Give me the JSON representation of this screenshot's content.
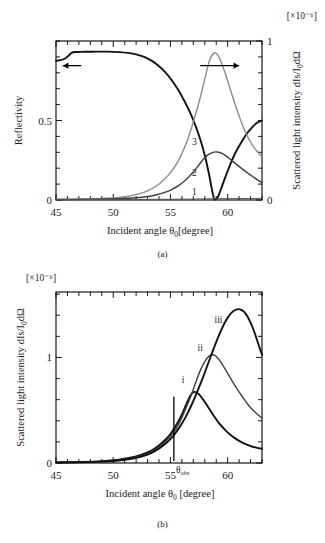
{
  "figure": {
    "panel_a_caption": "(a)",
    "panel_b_caption": "(b)",
    "exponent_label_a": "[×10⁻⁶]",
    "exponent_label_b": "[×10⁻⁶]",
    "bottom_note": ""
  },
  "chart_data": [
    {
      "id": "panel-a",
      "type": "line",
      "title": "",
      "panel_label": "(a)",
      "xlabel_parts": {
        "main": "Incident angle",
        "symbol": "θ",
        "subscript": "0",
        "units": "[degree]"
      },
      "xlabel": "Incident angle θ0 [degree]",
      "ylabel_left": "Reflectivity",
      "ylabel_right_parts": {
        "main": "Scattered light intensity",
        "formula": "dIs/I",
        "formula_sub": "0",
        "formula_tail": "dΩ"
      },
      "ylabel_right": "Scattered light intensity dIs/I0dΩ",
      "right_axis_scale": "[×10⁻⁶]",
      "xlim": [
        45,
        63
      ],
      "xticks_major": [
        45,
        50,
        55,
        60
      ],
      "xticks_minor_step": 1,
      "ylim_left": [
        0,
        1
      ],
      "yticks_left": [
        0,
        0.5
      ],
      "ytick_left_labels": [
        "0",
        "0.5"
      ],
      "ylim_right": [
        0,
        1
      ],
      "yticks_right": [
        0,
        1
      ],
      "ytick_right_labels": [
        "0",
        "1"
      ],
      "grid": false,
      "annotations": [
        {
          "name": "left-axis-arrow",
          "text": "",
          "direction": "left",
          "x_start": 47.2,
          "x_end": 45.6,
          "y_left": 0.845
        },
        {
          "name": "right-axis-arrow",
          "text": "",
          "direction": "right",
          "x_start": 57.6,
          "x_end": 61.0,
          "y_left": 0.845
        }
      ],
      "series": [
        {
          "name": "Reflectivity",
          "label": "",
          "axis": "left",
          "style": "thick-black",
          "points": [
            [
              45.0,
              0.875
            ],
            [
              45.4,
              0.88
            ],
            [
              45.8,
              0.89
            ],
            [
              46.1,
              0.908
            ],
            [
              46.4,
              0.927
            ],
            [
              46.8,
              0.931
            ],
            [
              47.5,
              0.932
            ],
            [
              48.5,
              0.933
            ],
            [
              49.5,
              0.933
            ],
            [
              50.5,
              0.93
            ],
            [
              51.3,
              0.925
            ],
            [
              52.0,
              0.916
            ],
            [
              52.7,
              0.9
            ],
            [
              53.3,
              0.878
            ],
            [
              53.9,
              0.848
            ],
            [
              54.5,
              0.808
            ],
            [
              55.1,
              0.755
            ],
            [
              55.7,
              0.69
            ],
            [
              56.2,
              0.625
            ],
            [
              56.7,
              0.552
            ],
            [
              57.2,
              0.465
            ],
            [
              57.6,
              0.382
            ],
            [
              58.0,
              0.282
            ],
            [
              58.35,
              0.17
            ],
            [
              58.6,
              0.075
            ],
            [
              58.8,
              0.012
            ],
            [
              58.95,
              0.003
            ],
            [
              59.15,
              0.02
            ],
            [
              59.45,
              0.075
            ],
            [
              59.8,
              0.145
            ],
            [
              60.2,
              0.22
            ],
            [
              60.7,
              0.3
            ],
            [
              61.2,
              0.363
            ],
            [
              61.7,
              0.42
            ],
            [
              62.2,
              0.462
            ],
            [
              62.6,
              0.487
            ],
            [
              63.0,
              0.5
            ]
          ]
        },
        {
          "name": "Curve 3",
          "label": "3",
          "label_x": 57.1,
          "label_y": 0.345,
          "axis": "right",
          "style": "grey",
          "points": [
            [
              45.0,
              0.004
            ],
            [
              47.0,
              0.006
            ],
            [
              49.0,
              0.01
            ],
            [
              50.5,
              0.016
            ],
            [
              51.5,
              0.026
            ],
            [
              52.3,
              0.04
            ],
            [
              53.0,
              0.058
            ],
            [
              53.6,
              0.08
            ],
            [
              54.2,
              0.112
            ],
            [
              54.8,
              0.155
            ],
            [
              55.3,
              0.2
            ],
            [
              55.8,
              0.262
            ],
            [
              56.2,
              0.325
            ],
            [
              56.6,
              0.4
            ],
            [
              57.0,
              0.492
            ],
            [
              57.4,
              0.59
            ],
            [
              57.8,
              0.7
            ],
            [
              58.1,
              0.79
            ],
            [
              58.4,
              0.875
            ],
            [
              58.7,
              0.918
            ],
            [
              58.95,
              0.925
            ],
            [
              59.2,
              0.905
            ],
            [
              59.5,
              0.855
            ],
            [
              59.9,
              0.772
            ],
            [
              60.3,
              0.68
            ],
            [
              60.8,
              0.57
            ],
            [
              61.3,
              0.47
            ],
            [
              61.8,
              0.39
            ],
            [
              62.3,
              0.33
            ],
            [
              62.7,
              0.295
            ],
            [
              63.0,
              0.272
            ]
          ]
        },
        {
          "name": "Curve 2",
          "label": "2",
          "label_x": 57.1,
          "label_y": 0.15,
          "axis": "right",
          "style": "mid",
          "points": [
            [
              45.0,
              0.003
            ],
            [
              48.0,
              0.005
            ],
            [
              50.5,
              0.008
            ],
            [
              52.0,
              0.014
            ],
            [
              53.0,
              0.022
            ],
            [
              53.8,
              0.033
            ],
            [
              54.5,
              0.048
            ],
            [
              55.1,
              0.066
            ],
            [
              55.7,
              0.09
            ],
            [
              56.2,
              0.118
            ],
            [
              56.7,
              0.152
            ],
            [
              57.1,
              0.185
            ],
            [
              57.5,
              0.222
            ],
            [
              57.9,
              0.258
            ],
            [
              58.3,
              0.285
            ],
            [
              58.7,
              0.3
            ],
            [
              59.1,
              0.302
            ],
            [
              59.5,
              0.293
            ],
            [
              60.0,
              0.27
            ],
            [
              60.5,
              0.24
            ],
            [
              61.1,
              0.205
            ],
            [
              61.7,
              0.172
            ],
            [
              62.3,
              0.142
            ],
            [
              62.7,
              0.122
            ],
            [
              63.0,
              0.11
            ]
          ]
        },
        {
          "name": "Curve 1",
          "label": "1",
          "label_x": 57.1,
          "label_y": 0.03,
          "axis": "right",
          "style": "flat",
          "points": [
            [
              45.0,
              0.002
            ],
            [
              50.0,
              0.003
            ],
            [
              54.0,
              0.004
            ],
            [
              57.0,
              0.006
            ],
            [
              59.0,
              0.008
            ],
            [
              61.0,
              0.009
            ],
            [
              63.0,
              0.01
            ]
          ]
        }
      ]
    },
    {
      "id": "panel-b",
      "type": "line",
      "title": "",
      "panel_label": "(b)",
      "xlabel_parts": {
        "main": "Incident angle",
        "symbol": "θ",
        "subscript": "0",
        "units": "[degree]"
      },
      "xlabel": "Incident angle θ0 [degree]",
      "ylabel_parts": {
        "main": "Scattered light intensity",
        "formula": "dIs/I",
        "formula_sub": "0",
        "formula_tail": "dΩ"
      },
      "ylabel": "Scattered light intensity dIs/I0dΩ",
      "y_axis_scale": "[×10⁻⁶]",
      "xlim": [
        45,
        63
      ],
      "xticks_major": [
        45,
        50,
        55,
        60
      ],
      "xticks_minor_step": 1,
      "ylim": [
        0,
        1.62
      ],
      "yticks": [
        0,
        1
      ],
      "ytick_labels": [
        "0",
        "1"
      ],
      "grid": false,
      "annotations": [
        {
          "name": "theta-obs-marker",
          "text": "θ",
          "subscript": "obs",
          "x": 55.3,
          "y_bottom": 0.02,
          "y_top": 0.63
        }
      ],
      "series": [
        {
          "name": "Curve i",
          "label": "i",
          "label_x": 56.1,
          "label_y": 0.76,
          "style": "thick-black",
          "points": [
            [
              45.0,
              0.006
            ],
            [
              47.0,
              0.01
            ],
            [
              49.0,
              0.018
            ],
            [
              50.5,
              0.032
            ],
            [
              51.5,
              0.05
            ],
            [
              52.3,
              0.072
            ],
            [
              53.0,
              0.1
            ],
            [
              53.6,
              0.135
            ],
            [
              54.1,
              0.175
            ],
            [
              54.6,
              0.225
            ],
            [
              55.0,
              0.275
            ],
            [
              55.4,
              0.34
            ],
            [
              55.8,
              0.415
            ],
            [
              56.1,
              0.485
            ],
            [
              56.4,
              0.56
            ],
            [
              56.7,
              0.63
            ],
            [
              56.95,
              0.668
            ],
            [
              57.2,
              0.672
            ],
            [
              57.5,
              0.65
            ],
            [
              57.9,
              0.595
            ],
            [
              58.3,
              0.528
            ],
            [
              58.8,
              0.445
            ],
            [
              59.3,
              0.37
            ],
            [
              59.9,
              0.3
            ],
            [
              60.5,
              0.245
            ],
            [
              61.2,
              0.198
            ],
            [
              61.9,
              0.165
            ],
            [
              62.5,
              0.145
            ],
            [
              63.0,
              0.135
            ]
          ]
        },
        {
          "name": "Curve ii",
          "label": "ii",
          "label_x": 57.6,
          "label_y": 1.06,
          "style": "mid",
          "points": [
            [
              45.0,
              0.005
            ],
            [
              47.0,
              0.008
            ],
            [
              49.0,
              0.014
            ],
            [
              50.5,
              0.026
            ],
            [
              51.5,
              0.042
            ],
            [
              52.3,
              0.062
            ],
            [
              53.0,
              0.088
            ],
            [
              53.6,
              0.12
            ],
            [
              54.2,
              0.165
            ],
            [
              54.7,
              0.215
            ],
            [
              55.2,
              0.28
            ],
            [
              55.6,
              0.345
            ],
            [
              56.0,
              0.43
            ],
            [
              56.4,
              0.53
            ],
            [
              56.8,
              0.64
            ],
            [
              57.2,
              0.76
            ],
            [
              57.6,
              0.875
            ],
            [
              58.0,
              0.96
            ],
            [
              58.4,
              1.015
            ],
            [
              58.75,
              1.025
            ],
            [
              59.1,
              1.0
            ],
            [
              59.5,
              0.94
            ],
            [
              60.0,
              0.85
            ],
            [
              60.6,
              0.74
            ],
            [
              61.2,
              0.64
            ],
            [
              61.8,
              0.55
            ],
            [
              62.4,
              0.48
            ],
            [
              63.0,
              0.425
            ]
          ]
        },
        {
          "name": "Curve iii",
          "label": "iii",
          "label_x": 59.2,
          "label_y": 1.33,
          "style": "thick-black",
          "points": [
            [
              45.0,
              0.004
            ],
            [
              47.0,
              0.007
            ],
            [
              49.0,
              0.013
            ],
            [
              50.5,
              0.024
            ],
            [
              51.5,
              0.038
            ],
            [
              52.3,
              0.056
            ],
            [
              53.0,
              0.08
            ],
            [
              53.6,
              0.11
            ],
            [
              54.2,
              0.152
            ],
            [
              54.8,
              0.205
            ],
            [
              55.3,
              0.265
            ],
            [
              55.8,
              0.34
            ],
            [
              56.3,
              0.43
            ],
            [
              56.8,
              0.54
            ],
            [
              57.3,
              0.665
            ],
            [
              57.8,
              0.8
            ],
            [
              58.3,
              0.945
            ],
            [
              58.8,
              1.09
            ],
            [
              59.3,
              1.225
            ],
            [
              59.8,
              1.34
            ],
            [
              60.3,
              1.42
            ],
            [
              60.8,
              1.455
            ],
            [
              61.2,
              1.45
            ],
            [
              61.6,
              1.41
            ],
            [
              62.0,
              1.33
            ],
            [
              62.4,
              1.22
            ],
            [
              62.7,
              1.12
            ],
            [
              63.0,
              1.025
            ]
          ]
        }
      ]
    }
  ]
}
